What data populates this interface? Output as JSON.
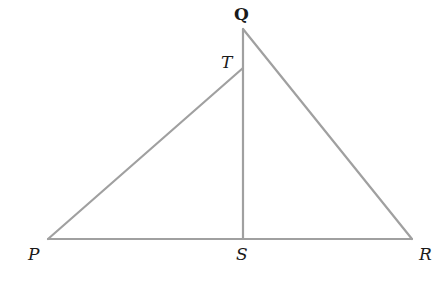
{
  "diagram": {
    "type": "geometry",
    "stroke_color": "#a0a0a0",
    "label_color": "#1a1a1a",
    "points": {
      "P": {
        "label": "P",
        "x": 48,
        "y": 239
      },
      "Q": {
        "label": "Q",
        "x": 243,
        "y": 29
      },
      "R": {
        "label": "R",
        "x": 412,
        "y": 239
      },
      "S": {
        "label": "S",
        "x": 243,
        "y": 239
      },
      "T": {
        "label": "T",
        "x": 243,
        "y": 68
      }
    },
    "segments": [
      [
        "P",
        "R"
      ],
      [
        "Q",
        "R"
      ],
      [
        "Q",
        "S"
      ],
      [
        "P",
        "T"
      ]
    ]
  }
}
